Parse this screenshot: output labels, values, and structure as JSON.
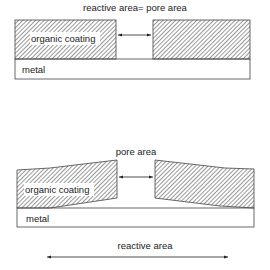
{
  "diagram": {
    "top": {
      "title": "reactive area= pore area",
      "coating_label": "organic coating",
      "metal_label": "metal"
    },
    "bottom": {
      "pore_label": "pore area",
      "coating_label": "organic coating",
      "metal_label": "metal",
      "reactive_label": "reactive area"
    }
  }
}
